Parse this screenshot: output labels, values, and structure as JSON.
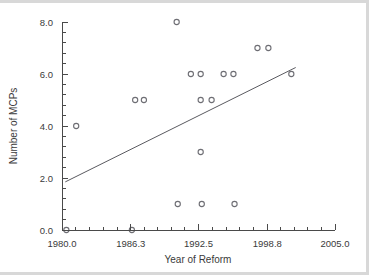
{
  "chart_data": {
    "type": "scatter",
    "title": "",
    "xlabel": "Year of Reform",
    "ylabel": "Number of MCPs",
    "xlim": [
      1980.0,
      2005.0
    ],
    "ylim": [
      0.0,
      8.0
    ],
    "xticks": [
      1980.0,
      1986.3,
      1992.5,
      1998.8,
      2005.0
    ],
    "xtick_labels": [
      "1980.0",
      "1986.3",
      "1992.5",
      "1998.8",
      "2005.0"
    ],
    "yticks": [
      0.0,
      2.0,
      4.0,
      6.0,
      8.0
    ],
    "ytick_labels": [
      "0.0",
      "2.0",
      "4.0",
      "6.0",
      "8.0"
    ],
    "x_minor_tick_count": 4,
    "y_minor_tick_count": 4,
    "grid": false,
    "legend": false,
    "marker": "open-circle",
    "marker_radius": 2.6,
    "marker_color": "#6e6e74",
    "points": [
      {
        "x": 1980.4,
        "y": 0
      },
      {
        "x": 1981.3,
        "y": 4
      },
      {
        "x": 1986.4,
        "y": 0
      },
      {
        "x": 1986.7,
        "y": 5
      },
      {
        "x": 1987.5,
        "y": 5
      },
      {
        "x": 1990.5,
        "y": 8
      },
      {
        "x": 1990.6,
        "y": 1
      },
      {
        "x": 1991.8,
        "y": 6
      },
      {
        "x": 1992.7,
        "y": 6
      },
      {
        "x": 1992.7,
        "y": 5
      },
      {
        "x": 1992.7,
        "y": 3
      },
      {
        "x": 1992.8,
        "y": 1
      },
      {
        "x": 1993.7,
        "y": 5
      },
      {
        "x": 1994.8,
        "y": 6
      },
      {
        "x": 1995.7,
        "y": 6
      },
      {
        "x": 1995.8,
        "y": 1
      },
      {
        "x": 1997.9,
        "y": 7
      },
      {
        "x": 1998.9,
        "y": 7
      },
      {
        "x": 2001.0,
        "y": 6
      }
    ],
    "trend_line": {
      "type": "linear-fit",
      "color": "#5a5a60",
      "x_start": 1980.3,
      "y_start": 1.85,
      "x_end": 2001.4,
      "y_end": 6.25
    }
  }
}
